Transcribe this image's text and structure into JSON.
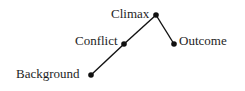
{
  "diagram": {
    "type": "plot-arc",
    "colors": {
      "line": "#111111",
      "dot": "#111111",
      "text": "#1e1e1e",
      "background": "#ffffff"
    },
    "nodes": [
      {
        "id": "background",
        "label": "Background",
        "x": 91,
        "y": 75
      },
      {
        "id": "conflict",
        "label": "Conflict",
        "x": 124,
        "y": 44
      },
      {
        "id": "climax",
        "label": "Climax",
        "x": 156,
        "y": 15
      },
      {
        "id": "outcome",
        "label": "Outcome",
        "x": 174,
        "y": 44
      }
    ],
    "edges": [
      {
        "from": "background",
        "to": "conflict"
      },
      {
        "from": "conflict",
        "to": "climax"
      },
      {
        "from": "climax",
        "to": "outcome"
      }
    ]
  }
}
